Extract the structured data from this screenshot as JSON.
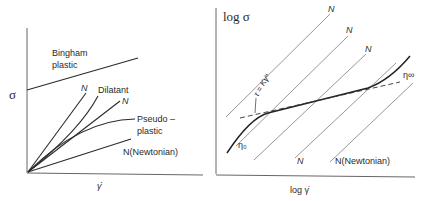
{
  "left_panel": {
    "y_label": "σ",
    "x_label": "γ̇",
    "curves": [
      {
        "id": "bingham",
        "label_line1": "Bingham",
        "label_line2": "plastic"
      },
      {
        "id": "newtonian-steep",
        "label": "N"
      },
      {
        "id": "dilatant",
        "label": "Dilatant"
      },
      {
        "id": "newtonian-mid",
        "label": "N"
      },
      {
        "id": "pseudoplastic",
        "label_line1": "Pseudo –",
        "label_line2": "plastic"
      },
      {
        "id": "newtonian-low",
        "label": "N(Newtonian)"
      }
    ]
  },
  "right_panel": {
    "y_label": "log  σ",
    "x_label": "log γ̇",
    "power_law_label": "τ = Kγ̇ⁿ",
    "eta_zero": "η₀",
    "eta_inf": "η∞",
    "newtonian_labels": [
      "N",
      "N",
      "N",
      "N",
      "N(Newtonian)"
    ]
  },
  "colors": {
    "ink": "#2a2a2a",
    "thin": "#6a6a6a",
    "axis": "#555555"
  }
}
